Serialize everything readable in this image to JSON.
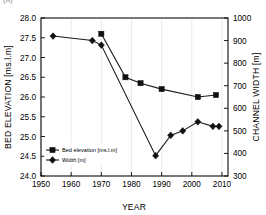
{
  "figure": {
    "panel_label": "(a)",
    "background": "#ffffff",
    "series_color": "#111111",
    "grid_color": "#e2e2e2"
  },
  "chart_data": {
    "type": "line",
    "title": "",
    "subtitle": "",
    "xlabel": "YEAR",
    "ylabel": "BED ELEVATION [ms.l.m]",
    "y2label": "CHANNEL WIDTH [m]",
    "xlim": [
      1950,
      2012
    ],
    "ylim": [
      24.0,
      28.0
    ],
    "y2lim": [
      300,
      1000
    ],
    "xticks": [
      1950,
      1960,
      1970,
      1980,
      1990,
      2000,
      2010
    ],
    "xticklabels": [
      "1950",
      "1960",
      "1970",
      "1980",
      "1990",
      "2000",
      "2010"
    ],
    "yticks": [
      24.0,
      24.5,
      25.0,
      25.5,
      26.0,
      26.5,
      27.0,
      27.5,
      28.0
    ],
    "yticklabels": [
      "24.0",
      "24.5",
      "25.0",
      "25.5",
      "26.0",
      "26.5",
      "27.0",
      "27.5",
      "28.0"
    ],
    "y2ticks": [
      300,
      400,
      500,
      600,
      700,
      800,
      900,
      1000
    ],
    "y2ticklabels": [
      "300",
      "400",
      "500",
      "600",
      "700",
      "800",
      "900",
      "1000"
    ],
    "grid": "vertical",
    "legend_position": "lower-left",
    "series": [
      {
        "name": "Bed elevation [ms.l.m]",
        "axis": "left",
        "marker": "square",
        "x": [
          1970,
          1978,
          1983,
          1990,
          2002,
          2008
        ],
        "y": [
          27.6,
          26.5,
          26.35,
          26.2,
          26.0,
          26.05
        ]
      },
      {
        "name": "Width [m]",
        "axis": "right",
        "marker": "diamond",
        "x": [
          1954,
          1967,
          1970,
          1988,
          1993,
          1997,
          2002,
          2007,
          2009
        ],
        "y": [
          920,
          900,
          880,
          390,
          480,
          500,
          540,
          520,
          520
        ]
      }
    ],
    "legend": [
      {
        "label": "Bed elevation [ms.l.m]",
        "marker": "square"
      },
      {
        "label": "Width [m]",
        "marker": "diamond"
      }
    ]
  }
}
